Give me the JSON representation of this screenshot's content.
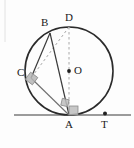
{
  "figure": {
    "type": "geometry-diagram",
    "background": "#fdfdfd",
    "stroke_dark": "#2b2b2b",
    "stroke_light": "#8d8d8d",
    "dash_color": "#a9a9a9",
    "marker_fill": "#b3b3b3",
    "width": 134,
    "height": 148
  },
  "circle": {
    "center": {
      "x": 69,
      "y": 71
    },
    "radius": 44,
    "label": "O"
  },
  "points": [
    {
      "id": "A",
      "label": "A",
      "x": 69,
      "y": 115,
      "label_x": 65,
      "label_y": 118,
      "dot": false
    },
    {
      "id": "B",
      "label": "B",
      "x": 50,
      "y": 33,
      "label_x": 41,
      "label_y": 18,
      "dot": false
    },
    {
      "id": "C",
      "label": "C",
      "x": 31,
      "y": 78,
      "label_x": 18,
      "label_y": 68,
      "dot": false
    },
    {
      "id": "D",
      "label": "D",
      "x": 69,
      "y": 27,
      "label_x": 65,
      "label_y": 13,
      "dot": false
    },
    {
      "id": "O",
      "label": "O",
      "x": 69,
      "y": 71,
      "label_x": 74,
      "label_y": 66,
      "dot": true
    },
    {
      "id": "T",
      "label": "T",
      "x": 105,
      "y": 114,
      "label_x": 101,
      "label_y": 118,
      "dot": true
    }
  ],
  "segments": [
    {
      "name": "B-C",
      "from": "B",
      "to": "C",
      "style": "solid",
      "color": "#3a3a3a"
    },
    {
      "name": "B-A",
      "from": "B",
      "to": "A",
      "style": "solid",
      "color": "#3a3a3a"
    },
    {
      "name": "C-A",
      "from": "C",
      "to": "A",
      "style": "solid",
      "color": "#6f6f6f"
    },
    {
      "name": "D-A",
      "from": "D",
      "to": "A",
      "style": "dashed",
      "color": "#a9a9a9"
    },
    {
      "name": "D-C",
      "from": "D",
      "to": "C",
      "style": "dashed",
      "color": "#a9a9a9"
    }
  ],
  "tangent_line": {
    "name": "tangent-at-A",
    "x1": 14,
    "y1": 115,
    "x2": 131,
    "y2": 115,
    "color": "#7a7a7a"
  },
  "right_angles": [
    {
      "name": "right-angle-at-C",
      "vertex": "C"
    },
    {
      "name": "right-angle-at-A-tangent",
      "vertex": "A"
    },
    {
      "name": "right-angle-at-A-inscribed",
      "vertex": "A"
    }
  ],
  "labels": {
    "A": "A",
    "B": "B",
    "C": "C",
    "D": "D",
    "O": "O",
    "T": "T"
  }
}
